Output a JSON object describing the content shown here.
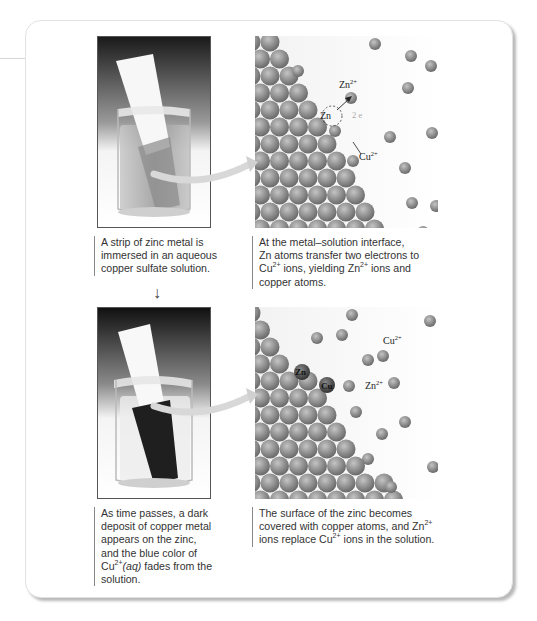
{
  "figure": {
    "panels": [
      {
        "id": "top",
        "photo_description": "Zinc strip immersed in blue copper sulfate solution in a beaker",
        "left_caption": [
          "A strip of zinc metal is",
          "immersed in an aqueous",
          "copper sulfate solution."
        ],
        "right_caption": {
          "line1": "At the metal–solution interface,",
          "line2": "Zn atoms transfer two electrons to",
          "line3_a": "Cu",
          "line3_sup1": "2+",
          "line3_b": " ions, yielding Zn",
          "line3_sup2": "2+",
          "line3_c": " ions and",
          "line4": "copper atoms."
        },
        "atom_labels": {
          "zn_ion": "Zn",
          "zn_ion_charge": "2+",
          "zn_atom": "Zn",
          "electrons": "2 e",
          "cu_ion": "Cu",
          "cu_ion_charge": "2+"
        }
      },
      {
        "id": "bottom",
        "photo_description": "Zinc strip covered with dark copper deposit; solution color faded",
        "left_caption": {
          "line1": "As time passes, a dark",
          "line2": "deposit of copper metal",
          "line3": "appears on the zinc,",
          "line4": "and the blue color of",
          "line5_a": "Cu",
          "line5_sup": "2+",
          "line5_b": "(aq)",
          "line5_c": " fades from the",
          "line6": "solution."
        },
        "right_caption": {
          "line1": "The surface of the zinc becomes",
          "line2_a": "covered with copper atoms, and Zn",
          "line2_sup": "2+",
          "line3_a": "ions replace Cu",
          "line3_sup": "2+",
          "line3_b": " ions in the solution."
        },
        "atom_labels": {
          "cu_ion": "Cu",
          "cu_ion_charge": "2+",
          "zn_atom": "Zn",
          "cu_atom": "Cu",
          "zn_ion": "Zn",
          "zn_ion_charge": "2+"
        }
      }
    ],
    "down_arrow": "↓",
    "colors": {
      "atom": "#8f8f8f",
      "frame_border": "#e2e2e2",
      "caption_rule": "#888888",
      "text": "#333333"
    }
  }
}
